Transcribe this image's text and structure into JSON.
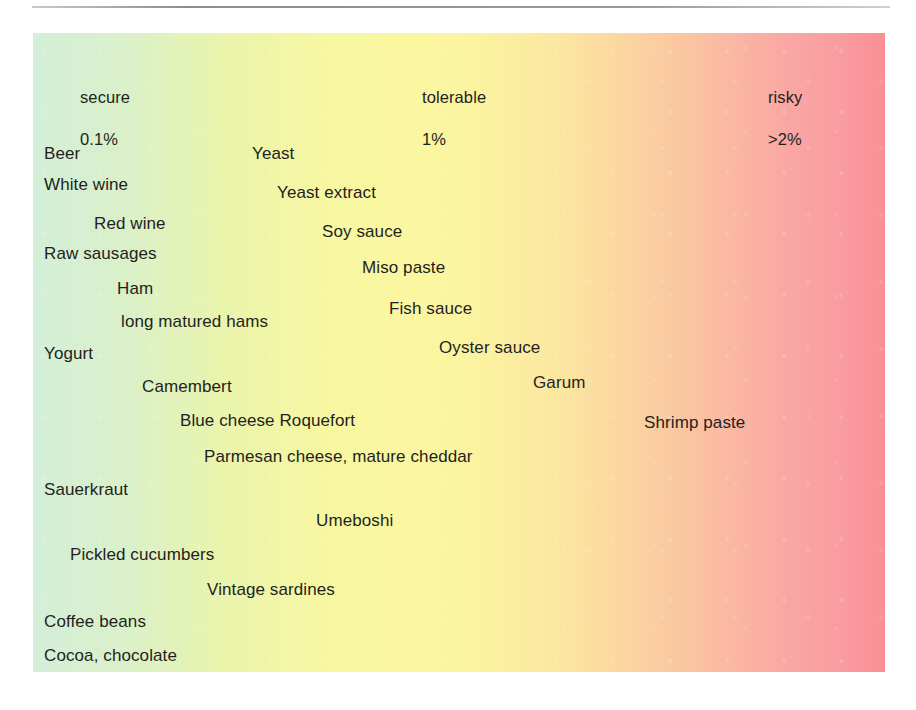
{
  "page": {
    "background_color": "#ffffff",
    "rule_color": "#9a9a9a"
  },
  "scale": {
    "gradient": {
      "from_color": "#d4efd9",
      "mid_color": "#fbf7a0",
      "to_color": "#fa8f96",
      "direction": "left-to-right"
    },
    "zones": [
      {
        "name": "secure",
        "label": "secure",
        "value": "0.1%",
        "x": 47,
        "label_y": 56,
        "value_y": 98
      },
      {
        "name": "tolerable",
        "label": "tolerable",
        "value": "1%",
        "x": 422,
        "label_y": 56,
        "value_y": 98
      },
      {
        "name": "risky",
        "label": "risky",
        "value": ">2%",
        "x": 768,
        "label_y": 56,
        "value_y": 98
      }
    ]
  },
  "items": [
    {
      "label": "Beer",
      "x": 44,
      "y": 145
    },
    {
      "label": "Yeast",
      "x": 252,
      "y": 145
    },
    {
      "label": "White wine",
      "x": 44,
      "y": 176
    },
    {
      "label": "Yeast extract",
      "x": 277,
      "y": 184
    },
    {
      "label": "Red wine",
      "x": 94,
      "y": 215
    },
    {
      "label": "Soy sauce",
      "x": 322,
      "y": 223
    },
    {
      "label": "Raw sausages",
      "x": 44,
      "y": 245
    },
    {
      "label": "Miso paste",
      "x": 362,
      "y": 259
    },
    {
      "label": "Ham",
      "x": 117,
      "y": 280
    },
    {
      "label": "Fish sauce",
      "x": 389,
      "y": 300
    },
    {
      "label": "long matured hams",
      "x": 121,
      "y": 313
    },
    {
      "label": "Oyster sauce",
      "x": 439,
      "y": 339
    },
    {
      "label": "Yogurt",
      "x": 44,
      "y": 345
    },
    {
      "label": "Camembert",
      "x": 142,
      "y": 378
    },
    {
      "label": "Garum",
      "x": 533,
      "y": 374
    },
    {
      "label": "Blue cheese Roquefort",
      "x": 180,
      "y": 412
    },
    {
      "label": "Shrimp paste",
      "x": 644,
      "y": 414
    },
    {
      "label": "Parmesan cheese, mature cheddar",
      "x": 204,
      "y": 448
    },
    {
      "label": "Sauerkraut",
      "x": 44,
      "y": 481
    },
    {
      "label": "Umeboshi",
      "x": 316,
      "y": 512
    },
    {
      "label": "Pickled cucumbers",
      "x": 70,
      "y": 546
    },
    {
      "label": "Vintage sardines",
      "x": 207,
      "y": 581
    },
    {
      "label": "Coffee beans",
      "x": 44,
      "y": 613
    },
    {
      "label": "Cocoa, chocolate",
      "x": 44,
      "y": 647
    }
  ]
}
